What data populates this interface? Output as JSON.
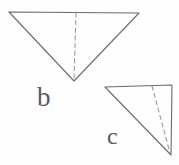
{
  "figure": {
    "background_color": "#fefefe",
    "stroke_color": "#6b6b6b",
    "dashed_stroke_color": "#9a9a9a",
    "label_color": "#5d5d5d",
    "width": 179,
    "height": 165
  },
  "shapes": {
    "triangle_b": {
      "name": "inverted-triangle",
      "points": "9,12 139,13 74,81",
      "vertices": [
        {
          "label": "top-left",
          "x": 9,
          "y": 12
        },
        {
          "label": "top-right",
          "x": 139,
          "y": 13
        },
        {
          "label": "bottom-apex",
          "x": 74,
          "y": 81
        }
      ],
      "dashed_line": {
        "name": "median-dashed-line",
        "x1": 76,
        "y1": 13,
        "x2": 74,
        "y2": 80
      }
    },
    "triangle_c": {
      "name": "right-triangle",
      "points": "105,87 172,85 171,155",
      "vertices": [
        {
          "label": "top-left",
          "x": 105,
          "y": 87
        },
        {
          "label": "top-right",
          "x": 172,
          "y": 85
        },
        {
          "label": "bottom-right",
          "x": 171,
          "y": 155
        }
      ],
      "dashed_line": {
        "name": "cevian-dashed-line",
        "x1": 152,
        "y1": 86,
        "x2": 170,
        "y2": 153
      }
    }
  },
  "labels": {
    "b": "b",
    "c": "c"
  }
}
